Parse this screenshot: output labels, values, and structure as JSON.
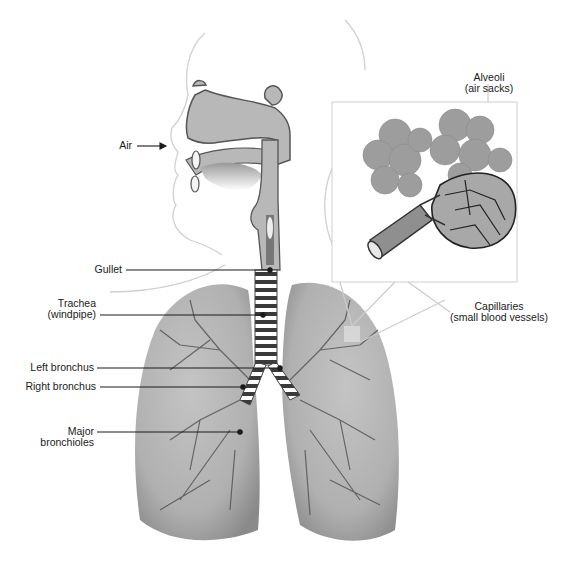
{
  "diagram": {
    "inset": "Alveoli detail (magnified)",
    "labels": {
      "air": "Air",
      "gullet": "Gullet",
      "trachea": {
        "line1": "Trachea",
        "line2": "(windpipe)"
      },
      "left_bronchus": "Left bronchus",
      "right_bronchus": "Right bronchus",
      "bronchioles": {
        "line1": "Major",
        "line2": "bronchioles"
      },
      "alveoli": {
        "line1": "Alveoli",
        "line2": "(air sacks)"
      },
      "capillaries": {
        "line1": "Capillaries",
        "line2": "(small blood vessels)"
      }
    },
    "colors": {
      "tissue": "#b5b5b5",
      "lung_light": "#c9c9c9",
      "lung_dark": "#8f8f8f",
      "vessel": "#555555",
      "outline": "#cfcfcf",
      "leader": "#1a1a1a"
    }
  }
}
